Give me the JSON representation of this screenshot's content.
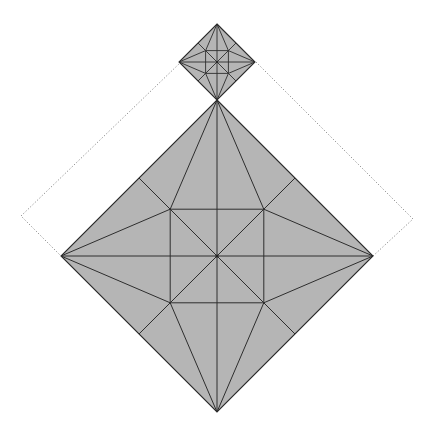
{
  "diagram": {
    "type": "origami-crease-pattern",
    "colors": {
      "paper_fill": "#b5b5b5",
      "crease_line": "#2e2e2e",
      "dotted_outline": "#8a8a8a",
      "background": "#ffffff"
    },
    "large_diamond": {
      "center": [
        217,
        256
      ],
      "half_diagonal": 156,
      "vertices": {
        "top": [
          217,
          100
        ],
        "right": [
          373,
          256
        ],
        "bottom": [
          217,
          412
        ],
        "left": [
          61,
          256
        ]
      },
      "inner_square_offset_ratio": 0.3,
      "inner_points": [
        [
          170,
          209
        ],
        [
          264,
          209
        ],
        [
          264,
          303
        ],
        [
          170,
          303
        ]
      ],
      "edge_midpoints": [
        [
          139,
          178
        ],
        [
          295,
          178
        ],
        [
          295,
          334
        ],
        [
          139,
          334
        ]
      ]
    },
    "small_diamond": {
      "center": [
        217,
        62
      ],
      "half_diagonal": 38,
      "vertices": {
        "top": [
          217,
          25
        ],
        "right": [
          256,
          62
        ],
        "bottom": [
          217,
          100
        ],
        "left": [
          181,
          62
        ]
      },
      "note": "scaled copy of the large crease pattern"
    },
    "dotted_outline": {
      "left_path": [
        [
          181,
          62
        ],
        [
          21,
          216
        ],
        [
          61,
          256
        ]
      ],
      "right_path": [
        [
          256,
          62
        ],
        [
          413,
          219
        ],
        [
          373,
          256
        ]
      ]
    }
  }
}
